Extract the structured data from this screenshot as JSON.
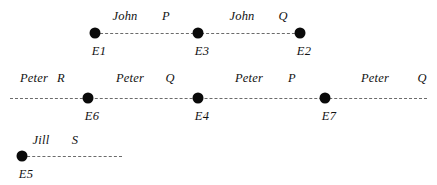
{
  "diagram": {
    "background_color": "#ffffff",
    "line_color": "#6b6b6b",
    "dot_color": "#0a0a0a",
    "text_color": "#111111",
    "lines": [
      {
        "id": "line-john",
        "actor": "John",
        "y": 33,
        "x_start": 95,
        "x_end": 300,
        "events": [
          {
            "id": "E1",
            "label": "E1",
            "x": 95,
            "label_y": 44
          },
          {
            "id": "E3",
            "label": "E3",
            "x": 198,
            "label_y": 44
          },
          {
            "id": "E2",
            "label": "E2",
            "x": 300,
            "label_y": 44
          }
        ],
        "segments": [
          {
            "actor": "John",
            "actor_x": 125,
            "action": "P",
            "action_x": 166,
            "y": 9
          },
          {
            "actor": "John",
            "actor_x": 242,
            "action": "Q",
            "action_x": 283,
            "y": 9
          }
        ]
      },
      {
        "id": "line-peter",
        "actor": "Peter",
        "y": 98,
        "x_start": 10,
        "x_end": 427,
        "events": [
          {
            "id": "E6",
            "label": "E6",
            "x": 88,
            "label_y": 109
          },
          {
            "id": "E4",
            "label": "E4",
            "x": 198,
            "label_y": 109
          },
          {
            "id": "E7",
            "label": "E7",
            "x": 325,
            "label_y": 109
          }
        ],
        "segments": [
          {
            "actor": "Peter",
            "actor_x": 34,
            "action": "R",
            "action_x": 61,
            "y": 71
          },
          {
            "actor": "Peter",
            "actor_x": 130,
            "action": "Q",
            "action_x": 170,
            "y": 71
          },
          {
            "actor": "Peter",
            "actor_x": 249,
            "action": "P",
            "action_x": 292,
            "y": 71
          },
          {
            "actor": "Peter",
            "actor_x": 375,
            "action": "Q",
            "action_x": 422,
            "y": 71
          }
        ]
      },
      {
        "id": "line-jill",
        "actor": "Jill",
        "y": 156,
        "x_start": 22,
        "x_end": 122,
        "events": [
          {
            "id": "E5",
            "label": "E5",
            "x": 22,
            "label_y": 167
          }
        ],
        "segments": [
          {
            "actor": "Jill",
            "actor_x": 41,
            "action": "S",
            "action_x": 75,
            "y": 133
          }
        ]
      }
    ]
  }
}
